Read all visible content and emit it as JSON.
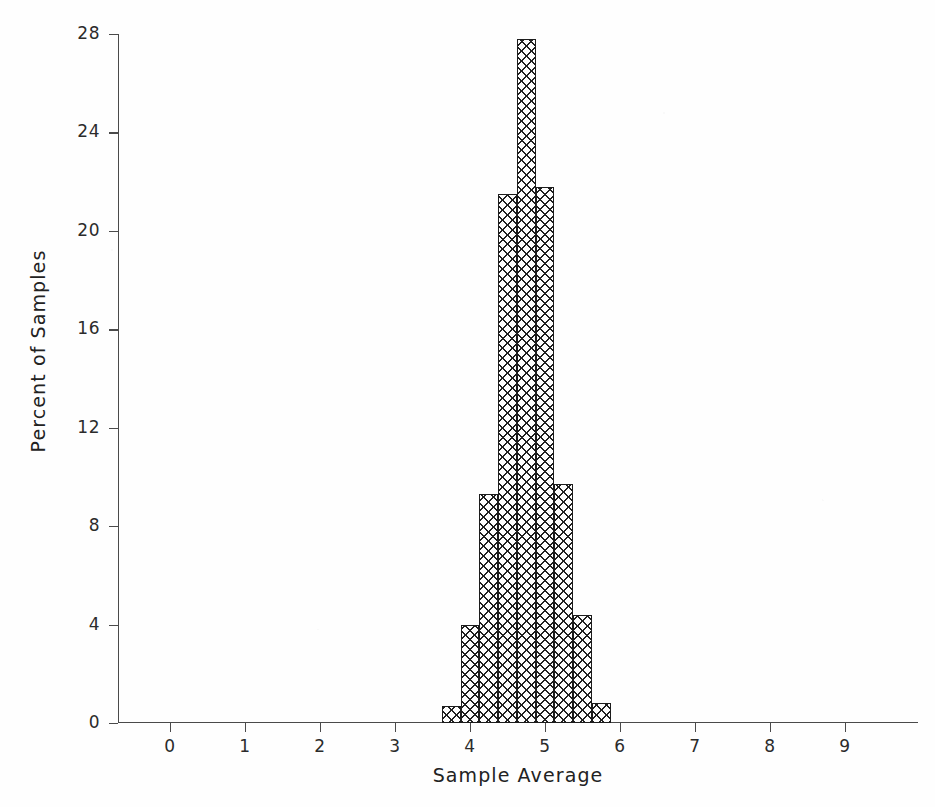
{
  "chart_data": {
    "type": "bar",
    "title": "",
    "subtitle": "",
    "xlabel": "Sample Average",
    "ylabel": "Percent of Samples",
    "xlim": [
      -0.6,
      10.0
    ],
    "ylim": [
      0,
      28
    ],
    "grid": false,
    "legend": null,
    "bin_width": 0.25,
    "x_ticks": [
      "0",
      "1",
      "2",
      "3",
      "4",
      "5",
      "6",
      "7",
      "8",
      "9"
    ],
    "x_tick_values": [
      0,
      1,
      2,
      3,
      4,
      5,
      6,
      7,
      8,
      9
    ],
    "y_ticks": [
      "0",
      "4",
      "8",
      "12",
      "16",
      "20",
      "24",
      "28"
    ],
    "y_tick_values": [
      0,
      4,
      8,
      12,
      16,
      20,
      24,
      28
    ],
    "categories": [
      "3.625",
      "3.875",
      "4.125",
      "4.375",
      "4.625",
      "4.875",
      "5.125",
      "5.375",
      "5.625"
    ],
    "bin_starts": [
      3.625,
      3.875,
      4.125,
      4.375,
      4.625,
      4.875,
      5.125,
      5.375,
      5.625
    ],
    "values": [
      0.7,
      4.0,
      9.3,
      21.5,
      27.8,
      21.8,
      9.7,
      4.4,
      0.8
    ],
    "bar_fill": "crosshatch",
    "bar_edge_color": "#1c1c1c",
    "background_color": "#fefefe",
    "axis_color": "#4a4a4a"
  },
  "figure": {
    "xlabel": "Sample Average",
    "ylabel": "Percent of Samples"
  }
}
